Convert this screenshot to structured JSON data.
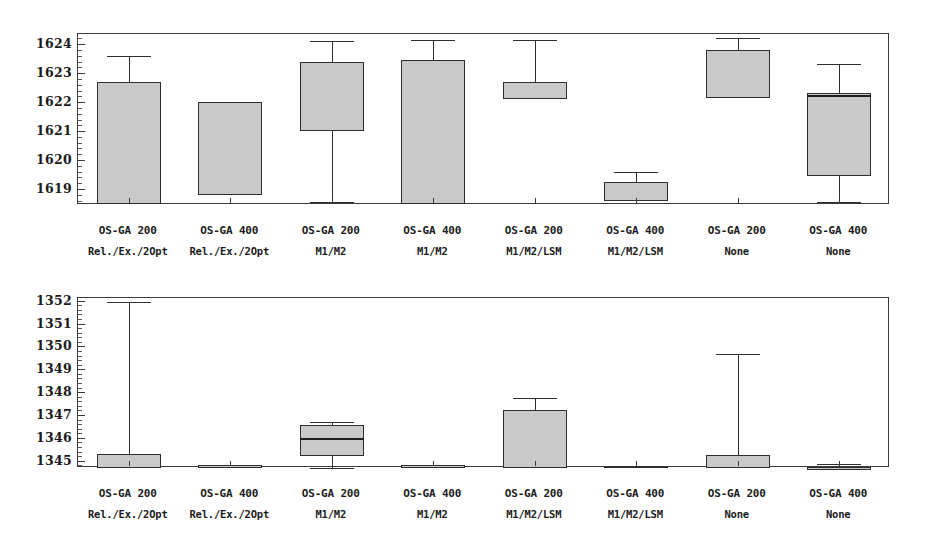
{
  "chart_data": [
    {
      "id": "top",
      "type": "box",
      "title": "",
      "xlabel": "",
      "ylabel": "",
      "ylim": [
        1618.45,
        1624.35
      ],
      "yticks": [
        1619,
        1620,
        1621,
        1622,
        1623,
        1624
      ],
      "ytick_labels": [
        "1619",
        "1620",
        "1621",
        "1622",
        "1623",
        "1624"
      ],
      "minor_ticks_per_interval": 5,
      "grid": false,
      "legend": "none",
      "categories": [
        {
          "line1": "OS-GA 200",
          "line2": "Rel./Ex./2Opt"
        },
        {
          "line1": "OS-GA 400",
          "line2": "Rel./Ex./2Opt"
        },
        {
          "line1": "OS-GA 200",
          "line2": "M1/M2"
        },
        {
          "line1": "OS-GA 400",
          "line2": "M1/M2"
        },
        {
          "line1": "OS-GA 200",
          "line2": "M1/M2/LSM"
        },
        {
          "line1": "OS-GA 400",
          "line2": "M1/M2/LSM"
        },
        {
          "line1": "OS-GA 200",
          "line2": "None"
        },
        {
          "line1": "OS-GA 400",
          "line2": "None"
        }
      ],
      "boxes": [
        {
          "name": "OS-GA 200 Rel./Ex./2Opt",
          "min": 1618.5,
          "q1": 1618.5,
          "median": null,
          "q3": 1622.7,
          "max": 1623.6
        },
        {
          "name": "OS-GA 400 Rel./Ex./2Opt",
          "min": 1618.8,
          "q1": 1618.8,
          "median": null,
          "q3": 1622.0,
          "max": 1622.0
        },
        {
          "name": "OS-GA 200 M1/M2",
          "min": 1618.55,
          "q1": 1621.0,
          "median": null,
          "q3": 1623.4,
          "max": 1624.1
        },
        {
          "name": "OS-GA 400 M1/M2",
          "min": 1618.5,
          "q1": 1618.5,
          "median": null,
          "q3": 1623.45,
          "max": 1624.15
        },
        {
          "name": "OS-GA 200 M1/M2/LSM",
          "min": 1622.1,
          "q1": 1622.1,
          "median": null,
          "q3": 1622.7,
          "max": 1624.15
        },
        {
          "name": "OS-GA 400 M1/M2/LSM",
          "min": 1618.6,
          "q1": 1618.6,
          "median": null,
          "q3": 1619.25,
          "max": 1619.6
        },
        {
          "name": "OS-GA 200 None",
          "min": 1622.15,
          "q1": 1622.15,
          "median": null,
          "q3": 1623.8,
          "max": 1624.2
        },
        {
          "name": "OS-GA 400 None",
          "min": 1618.55,
          "q1": 1619.45,
          "median": 1622.25,
          "q3": 1622.3,
          "max": 1623.3
        }
      ]
    },
    {
      "id": "bottom",
      "type": "box",
      "title": "",
      "xlabel": "",
      "ylabel": "",
      "ylim": [
        1344.68,
        1352.12
      ],
      "yticks": [
        1345,
        1346,
        1347,
        1348,
        1349,
        1350,
        1351,
        1352
      ],
      "ytick_labels": [
        "1345",
        "1346",
        "1347",
        "1348",
        "1349",
        "1350",
        "1351",
        "1352"
      ],
      "minor_ticks_per_interval": 5,
      "grid": false,
      "legend": "none",
      "categories": [
        {
          "line1": "OS-GA 200",
          "line2": "Rel./Ex./2Opt"
        },
        {
          "line1": "OS-GA 400",
          "line2": "Rel./Ex./2Opt"
        },
        {
          "line1": "OS-GA 200",
          "line2": "M1/M2"
        },
        {
          "line1": "OS-GA 400",
          "line2": "M1/M2"
        },
        {
          "line1": "OS-GA 200",
          "line2": "M1/M2/LSM"
        },
        {
          "line1": "OS-GA 400",
          "line2": "M1/M2/LSM"
        },
        {
          "line1": "OS-GA 200",
          "line2": "None"
        },
        {
          "line1": "OS-GA 400",
          "line2": "None"
        }
      ],
      "boxes": [
        {
          "name": "OS-GA 200 Rel./Ex./2Opt",
          "min": 1344.7,
          "q1": 1344.7,
          "median": null,
          "q3": 1345.3,
          "max": 1351.95
        },
        {
          "name": "OS-GA 400 Rel./Ex./2Opt",
          "min": 1344.7,
          "q1": 1344.7,
          "median": null,
          "q3": 1344.8,
          "max": 1344.8
        },
        {
          "name": "OS-GA 200 M1/M2",
          "min": 1344.7,
          "q1": 1345.2,
          "median": 1346.0,
          "q3": 1346.55,
          "max": 1346.7
        },
        {
          "name": "OS-GA 400 M1/M2",
          "min": 1344.7,
          "q1": 1344.7,
          "median": null,
          "q3": 1344.8,
          "max": 1344.8
        },
        {
          "name": "OS-GA 200 M1/M2/LSM",
          "min": 1344.7,
          "q1": 1344.7,
          "median": null,
          "q3": 1347.2,
          "max": 1347.75
        },
        {
          "name": "OS-GA 400 M1/M2/LSM",
          "min": 1344.7,
          "q1": 1344.7,
          "median": null,
          "q3": 1344.78,
          "max": 1344.78
        },
        {
          "name": "OS-GA 200 None",
          "min": 1344.7,
          "q1": 1344.7,
          "median": null,
          "q3": 1345.25,
          "max": 1349.65
        },
        {
          "name": "OS-GA 400 None",
          "min": 1344.7,
          "q1": 1344.7,
          "median": null,
          "q3": 1344.72,
          "max": 1344.85
        }
      ]
    }
  ],
  "colors": {
    "box_fill": "#c9c9c9",
    "box_stroke": "#2e2e2e",
    "axis": "#3a3a3a",
    "text": "#1b1b1b",
    "background": "#ffffff"
  }
}
